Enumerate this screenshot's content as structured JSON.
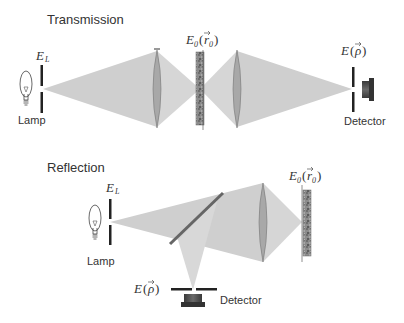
{
  "transmission": {
    "title": "Transmission",
    "lamp_label": "Lamp",
    "detector_label": "Detector",
    "source_field": {
      "E": "E",
      "sub": "L"
    },
    "sample_field": {
      "E": "E",
      "sub": "0",
      "open": "(",
      "r": "r",
      "rsub": "0",
      "close": ")"
    },
    "detector_field": {
      "E": "E",
      "open": "(",
      "rho": "ρ",
      "close": ")"
    }
  },
  "reflection": {
    "title": "Reflection",
    "lamp_label": "Lamp",
    "detector_label": "Detector",
    "source_field": {
      "E": "E",
      "sub": "L"
    },
    "sample_field": {
      "E": "E",
      "sub": "0",
      "open": "(",
      "r": "r",
      "rsub": "0",
      "close": ")"
    },
    "detector_field": {
      "E": "E",
      "open": "(",
      "rho": "ρ",
      "close": ")"
    }
  },
  "colors": {
    "beam": "#cfcfcf",
    "lens": "#a8a8a8",
    "aperture": "#222222",
    "sample": "#8a8a8a",
    "detector": "#4a4a4a",
    "mirror": "#666666"
  }
}
